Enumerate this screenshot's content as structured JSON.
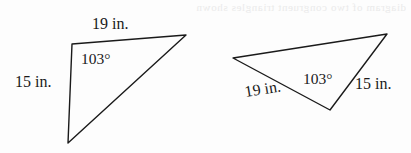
{
  "page": {
    "background_color": "#fdfdfd",
    "ink_color": "#1a1a1a",
    "bleed_through_text": "diagram of two congruent triangles shown"
  },
  "figure": {
    "name": "congruent-triangles-pair",
    "triangles": [
      {
        "id": "left-triangle",
        "vertices": [
          {
            "name": "top-left",
            "x": 72,
            "y": 44
          },
          {
            "name": "right-apex",
            "x": 186,
            "y": 35
          },
          {
            "name": "bottom",
            "x": 68,
            "y": 143
          }
        ],
        "labels": {
          "top_side": "19 in.",
          "left_side": "15 in.",
          "angle": "103°"
        }
      },
      {
        "id": "right-triangle",
        "vertices": [
          {
            "name": "left",
            "x": 233,
            "y": 58
          },
          {
            "name": "top-right-apex",
            "x": 387,
            "y": 34
          },
          {
            "name": "bottom",
            "x": 330,
            "y": 110
          }
        ],
        "labels": {
          "lower_left_side": "19 in.",
          "right_side": "15 in.",
          "angle": "103°"
        }
      }
    ]
  }
}
